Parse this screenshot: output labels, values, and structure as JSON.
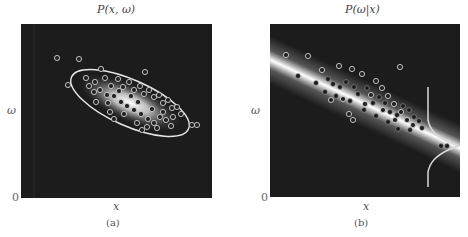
{
  "figure": {
    "panels": [
      {
        "id": "a",
        "title": "P(x, ω)",
        "xlabel": "x",
        "ylabel": "ω",
        "origin_label": "0",
        "caption": "(a)",
        "description": "Joint density rendered as a bright elliptical blob with an elliptical contour; open-circle samples clustered along a negatively sloped diagonal"
      },
      {
        "id": "b",
        "title": "P(ω|x)",
        "xlabel": "x",
        "ylabel": "ω",
        "origin_label": "0",
        "caption": "(b)",
        "description": "Conditional density rendered as a bright diagonal band; samples shown as filled and open dots; a vertical slice with a Gaussian bump on the right"
      }
    ],
    "colors": {
      "background": "#1c1c1c",
      "highlight": "#ffffff",
      "contour": "#e8e8e8",
      "page": "#ffffff"
    }
  }
}
